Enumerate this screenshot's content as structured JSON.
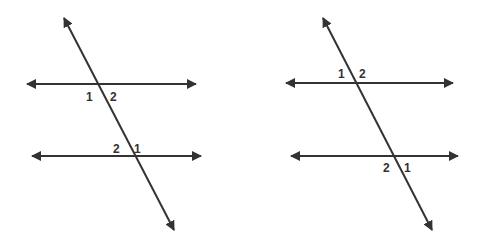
{
  "colors": {
    "line": "#333333",
    "background": "#ffffff"
  },
  "diagrams": [
    {
      "name": "left-figure",
      "transversal": {
        "x1": 64,
        "y1": 18,
        "x2": 174,
        "y2": 230
      },
      "parallel_lines": [
        {
          "x1": 27,
          "y1": 84,
          "x2": 196,
          "y2": 84
        },
        {
          "x1": 32,
          "y1": 156,
          "x2": 201,
          "y2": 156
        }
      ],
      "labels": [
        {
          "text": "1",
          "x": 86,
          "y": 101
        },
        {
          "text": "2",
          "x": 110,
          "y": 101
        },
        {
          "text": "2",
          "x": 113,
          "y": 153
        },
        {
          "text": "1",
          "x": 134,
          "y": 153
        }
      ]
    },
    {
      "name": "right-figure",
      "transversal": {
        "x1": 323,
        "y1": 18,
        "x2": 432,
        "y2": 230
      },
      "parallel_lines": [
        {
          "x1": 286,
          "y1": 83,
          "x2": 453,
          "y2": 83
        },
        {
          "x1": 291,
          "y1": 156,
          "x2": 458,
          "y2": 156
        }
      ],
      "labels": [
        {
          "text": "1",
          "x": 338,
          "y": 78
        },
        {
          "text": "2",
          "x": 359,
          "y": 78
        },
        {
          "text": "2",
          "x": 383,
          "y": 172
        },
        {
          "text": "1",
          "x": 404,
          "y": 172
        }
      ]
    }
  ]
}
